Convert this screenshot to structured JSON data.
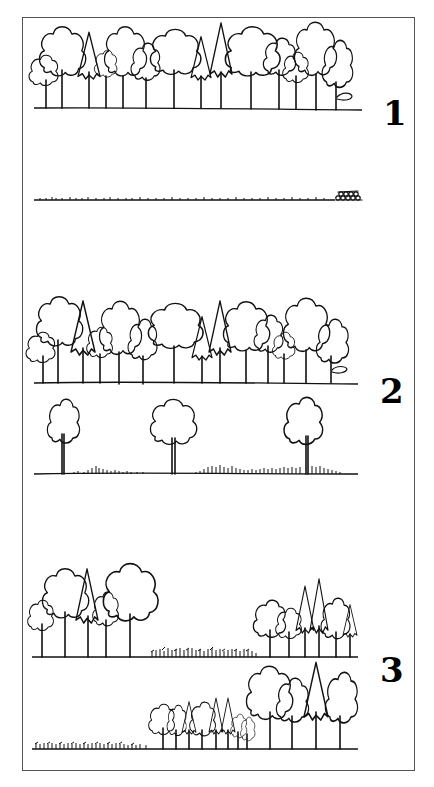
{
  "figure": {
    "type": "forest stand silviculture diagram",
    "style": "black ink line drawing on white",
    "border_color": "#555555",
    "ink_color": "#111111"
  },
  "panels": [
    {
      "label": "1",
      "before": "continuous mature mixed stand (broadleaf and conifer trees) on level ground",
      "after": "clearcut: bare ground with stumps and slash, log pile at right end"
    },
    {
      "label": "2",
      "before": "continuous mature mixed stand",
      "after": "seed-tree cut: three scattered remaining trees with regenerating grass/seedlings"
    },
    {
      "label": "3",
      "before": "strip/patch cut: mature trees left and right, young regeneration in middle gap",
      "after": "regeneration in left strip, mid-age trees in center, mature trees at right"
    }
  ]
}
